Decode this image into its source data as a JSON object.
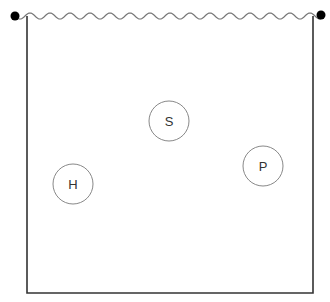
{
  "diagram": {
    "type": "container-with-nodes",
    "container": {
      "left_x": 27,
      "right_x": 313,
      "top_y": 16,
      "bottom_y": 293,
      "stroke": "#333333",
      "top_edge": "wavy"
    },
    "endpoints": [
      {
        "name": "left-anchor",
        "cx": 15,
        "cy": 16,
        "r": 4.5
      },
      {
        "name": "right-anchor",
        "cx": 321,
        "cy": 15,
        "r": 4.5
      }
    ],
    "nodes": [
      {
        "id": "S",
        "label": "S",
        "cx": 169,
        "cy": 121,
        "r": 20
      },
      {
        "id": "H",
        "label": "H",
        "cx": 73,
        "cy": 184,
        "r": 20
      },
      {
        "id": "P",
        "label": "P",
        "cx": 263,
        "cy": 166,
        "r": 20
      }
    ],
    "colors": {
      "line": "#333333",
      "circle_stroke": "#888888",
      "label": "#333333",
      "wave": "#777777"
    }
  }
}
